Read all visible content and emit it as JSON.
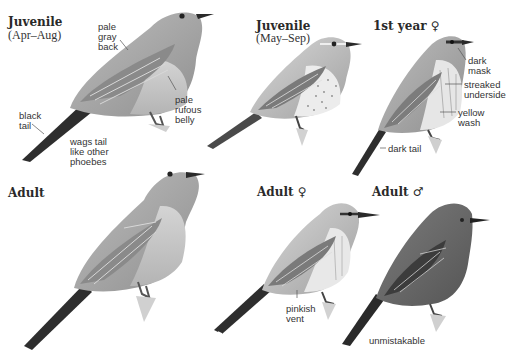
{
  "panels": [
    {
      "id": "juvenile-early",
      "heading": "Juvenile",
      "subheading": "(Apr–Aug)",
      "notes": [
        "pale\ngray\nback",
        "pale\nrufous\nbelly",
        "black\ntail",
        "wags tail\nlike other\nphoebes"
      ]
    },
    {
      "id": "juvenile-late",
      "heading": "Juvenile",
      "subheading": "(May–Sep)",
      "notes": []
    },
    {
      "id": "first-year-female",
      "heading": "1st year ♀",
      "notes": [
        "dark\nmask",
        "streaked\nunderside",
        "yellow\nwash",
        "dark tail"
      ]
    },
    {
      "id": "adult",
      "heading": "Adult",
      "notes": []
    },
    {
      "id": "adult-female",
      "heading": "Adult ♀",
      "notes": [
        "pinkish\nvent"
      ]
    },
    {
      "id": "adult-male",
      "heading": "Adult ♂",
      "notes": [
        "unmistakable"
      ]
    }
  ],
  "colors": {
    "background": "#ffffff",
    "bird_gray": "#a8a8a8",
    "bird_dark": "#3a3a3a",
    "adult_male_body": "#6e6e6e"
  }
}
